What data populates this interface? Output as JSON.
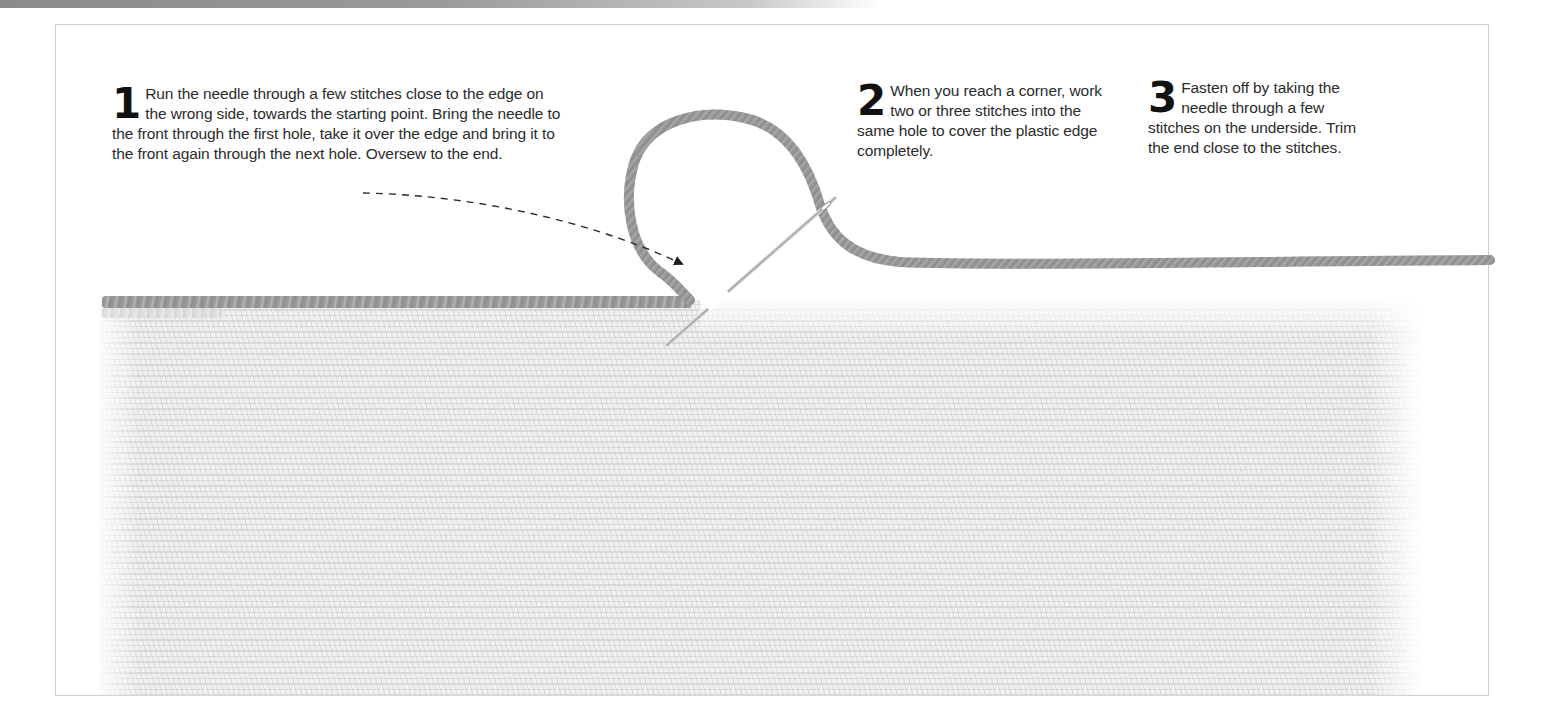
{
  "page": {
    "type": "craft instruction illustration"
  },
  "steps": [
    {
      "number": "1",
      "text": "Run the needle through a few stitches close to the edge on the wrong side, towards the starting point. Bring the needle to the front through the first hole, take it over the edge and bring it to the front again through the next hole. Oversew to the end."
    },
    {
      "number": "2",
      "text": "When you reach a corner, work two or three stitches into the same hole to cover the plastic edge completely."
    },
    {
      "number": "3",
      "text": "Fasten off by taking the needle through a few stitches on the underside. Trim the end close to the stitches."
    }
  ],
  "illustration": {
    "elements": [
      "plastic-canvas",
      "overcast-edge-stitches",
      "yarn-loop",
      "tapestry-needle",
      "dashed-arrow",
      "yarn-tail"
    ],
    "colors": {
      "yarn": "#9a9a9a",
      "canvas": "#eeeeee",
      "text": "#2b2b2b",
      "frame": "#cfcfcf",
      "arrow": "#222222"
    }
  }
}
